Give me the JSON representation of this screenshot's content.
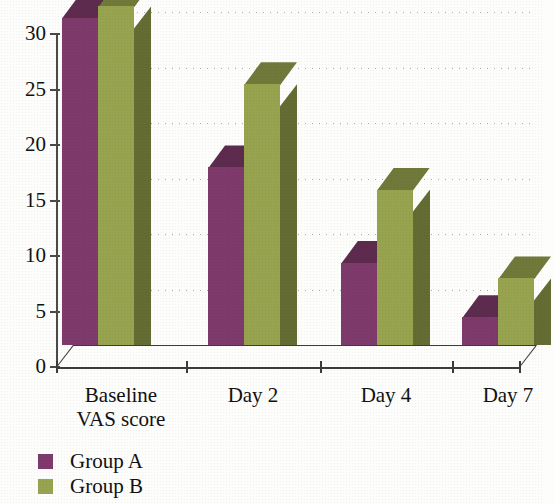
{
  "chart_data": {
    "type": "bar",
    "title": "",
    "subtitle": "",
    "xlabel": "",
    "ylabel": "",
    "categories": [
      "Baseline VAS score",
      "Day 2",
      "Day 4",
      "Day 7"
    ],
    "category_lines": [
      [
        "Baseline",
        "VAS score"
      ],
      [
        "Day 2"
      ],
      [
        "Day 4"
      ],
      [
        "Day 7"
      ]
    ],
    "series": [
      {
        "name": "Group A",
        "color": "#7d3a6a",
        "values": [
          29.5,
          16,
          7.4,
          2.5
        ]
      },
      {
        "name": "Group B",
        "color": "#97a34e",
        "values": [
          30.5,
          23.5,
          14,
          6
        ]
      }
    ],
    "ylim": [
      0,
      30
    ],
    "yticks": [
      0,
      5,
      10,
      15,
      20,
      25,
      30
    ],
    "ytick_labels": [
      "0",
      "5",
      "10",
      "15",
      "20",
      "25",
      "30"
    ],
    "grid": true,
    "grid_style": "dotted",
    "legend_position": "bottom-left",
    "three_d": true
  },
  "legend": {
    "items": [
      {
        "label": "Group A",
        "color": "#7d3a6a"
      },
      {
        "label": "Group B",
        "color": "#97a34e"
      }
    ]
  },
  "colors": {
    "group_a_front": "#7d3a6a",
    "group_a_shade": "#5d2d4e",
    "group_b_front": "#97a34e",
    "group_b_shade": "#6b6e3a",
    "axis": "#3c3c3c",
    "grid": "#9a9a9a",
    "background": "#fdfdfb"
  }
}
